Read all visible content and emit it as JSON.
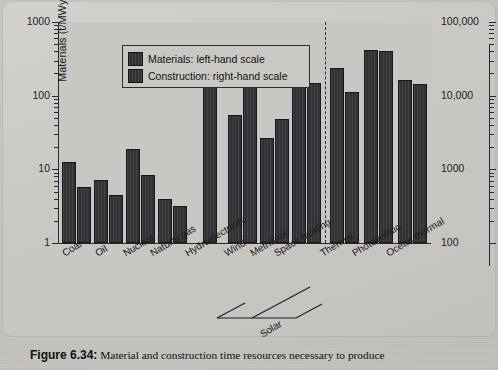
{
  "figure": {
    "caption_label": "Figure 6.34:",
    "caption_text": "Material and construction time resources necessary to produce"
  },
  "legend": {
    "items": [
      {
        "label": "Materials: left-hand scale",
        "swatch": "dark-hatched-bar"
      },
      {
        "label": "Construction: right-hand scale",
        "swatch": "dark-hatched-bar"
      }
    ]
  },
  "axes": {
    "left": {
      "title_main": "Materials (t/MWy",
      "title_sub": "e",
      "title_close": ")",
      "ticks": [
        "1000",
        "100",
        "10",
        "1"
      ]
    },
    "right": {
      "title_main": "Construction (person-hours per MWy",
      "title_sub": "e",
      "title_close": ")",
      "ticks": [
        "100,000",
        "10,000",
        "1000",
        "100"
      ]
    }
  },
  "group_bracket": {
    "label": "Solar",
    "from": "Space heating",
    "to": "Photovoltaic"
  },
  "chart_data": {
    "type": "bar",
    "title": "Material and construction time resources necessary to produce",
    "xlabel": "",
    "ylabel": "Materials (t/MWye)",
    "y2label": "Construction (person-hours per MWye)",
    "scale": "log",
    "ylim": [
      1,
      1000
    ],
    "y2lim": [
      100,
      100000
    ],
    "grid": false,
    "legend_position": "top-left",
    "categories": [
      "Coal",
      "Oil",
      "Nuclear",
      "Natural gas",
      "Hydroelectricity",
      "Wind",
      "Methanol",
      "Space heating",
      "Thermal",
      "Photovoltaic",
      "Ocean thermal"
    ],
    "series": [
      {
        "name": "Materials: left-hand scale",
        "axis": "left",
        "unit": "t/MWye",
        "values": [
          12.6,
          7.2,
          19,
          3.9,
          null,
          55,
          27,
          270,
          235,
          420,
          165
        ]
      },
      {
        "name": "Construction: right-hand scale",
        "axis": "right",
        "unit": "person-hours per MWye",
        "values": [
          580,
          450,
          830,
          320,
          23500,
          19000,
          4900,
          15000,
          11200,
          41000,
          14500
        ]
      }
    ],
    "annotations": [
      {
        "text": "Solar",
        "type": "group-bracket",
        "spans": [
          "Space heating",
          "Thermal",
          "Photovoltaic"
        ]
      },
      {
        "text": "dashed vertical divider",
        "type": "divider",
        "after_category": "Space heating"
      }
    ]
  }
}
